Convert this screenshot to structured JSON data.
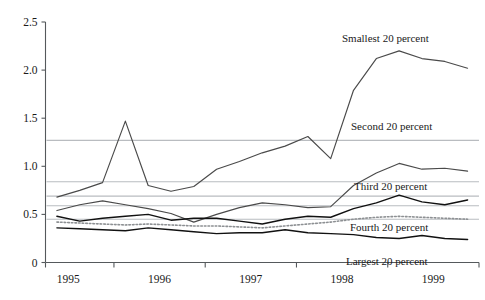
{
  "chart_data": {
    "type": "line",
    "title": "",
    "subtitle": "",
    "xlabel": "",
    "ylabel": "",
    "ylim": [
      0,
      2.5
    ],
    "xlim": [
      1994.75,
      1999.5
    ],
    "grid": false,
    "legend_position": "inline-annotations",
    "ytick_labels": [
      "0",
      "0.5",
      "1.0",
      "1.5",
      "2.0",
      "2.5"
    ],
    "ytick_values": [
      0,
      0.5,
      1.0,
      1.5,
      2.0,
      2.5
    ],
    "xtick_labels": [
      "1995",
      "1996",
      "1997",
      "1998",
      "1999"
    ],
    "xtick_values": [
      1995,
      1996,
      1997,
      1998,
      1999
    ],
    "x": [
      1994.875,
      1995.125,
      1995.375,
      1995.625,
      1995.875,
      1996.125,
      1996.375,
      1996.625,
      1996.875,
      1997.125,
      1997.375,
      1997.625,
      1997.875,
      1998.125,
      1998.375,
      1998.625,
      1998.875,
      1999.125,
      1999.375
    ],
    "series": [
      {
        "name": "Smallest 20 percent",
        "style": "solid",
        "color": "#4a4a4a",
        "width": 1.15,
        "mean_line": 1.27,
        "values": [
          0.68,
          0.75,
          0.83,
          1.47,
          0.8,
          0.74,
          0.79,
          0.97,
          1.05,
          1.14,
          1.21,
          1.31,
          1.08,
          1.79,
          2.12,
          2.2,
          2.12,
          2.09,
          2.02
        ]
      },
      {
        "name": "Second 20 percent",
        "style": "solid",
        "color": "#4a4a4a",
        "width": 1.15,
        "mean_line": 0.84,
        "values": [
          0.54,
          0.6,
          0.64,
          0.6,
          0.56,
          0.51,
          0.42,
          0.5,
          0.57,
          0.62,
          0.6,
          0.57,
          0.58,
          0.8,
          0.93,
          1.03,
          0.97,
          0.98,
          0.95
        ]
      },
      {
        "name": "Third 20 percent",
        "style": "solid",
        "color": "#111111",
        "width": 1.45,
        "mean_line": 0.69,
        "values": [
          0.48,
          0.43,
          0.46,
          0.48,
          0.5,
          0.44,
          0.46,
          0.46,
          0.43,
          0.4,
          0.45,
          0.48,
          0.47,
          0.56,
          0.62,
          0.7,
          0.63,
          0.6,
          0.65
        ]
      },
      {
        "name": "Fourth 20 percent",
        "style": "dotted",
        "color": "#8d9093",
        "width": 1.6,
        "mean_line": 0.59,
        "values": [
          0.42,
          0.41,
          0.4,
          0.39,
          0.4,
          0.39,
          0.38,
          0.38,
          0.37,
          0.36,
          0.38,
          0.4,
          0.42,
          0.45,
          0.47,
          0.48,
          0.47,
          0.46,
          0.45
        ]
      },
      {
        "name": "Largest 20 percent",
        "style": "solid",
        "color": "#111111",
        "width": 1.45,
        "mean_line": 0.45,
        "values": [
          0.36,
          0.35,
          0.34,
          0.33,
          0.36,
          0.34,
          0.32,
          0.3,
          0.31,
          0.31,
          0.34,
          0.31,
          0.3,
          0.29,
          0.26,
          0.25,
          0.28,
          0.25,
          0.24
        ]
      }
    ],
    "annotations": [
      {
        "text": "Smallest 20 percent",
        "x_px": 342,
        "y_px": 42
      },
      {
        "text": "Second 20 percent",
        "x_px": 351,
        "y_px": 130
      },
      {
        "text": "Third 20 percent",
        "x_px": 354,
        "y_px": 190
      },
      {
        "text": "Fourth 20 percent",
        "x_px": 350,
        "y_px": 231
      },
      {
        "text": "Largest 20 percent",
        "x_px": 346,
        "y_px": 265
      }
    ]
  }
}
